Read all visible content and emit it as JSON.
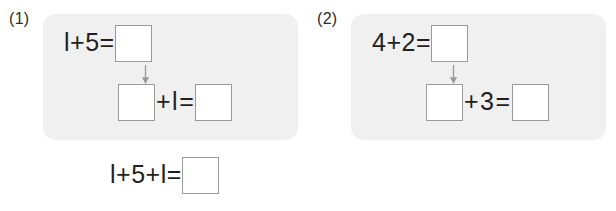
{
  "worksheet": {
    "title": "Two-step addition worksheet",
    "background_color": "#ffffff",
    "panel_color": "#f0f0f0",
    "box_border_color": "#9a9a9a",
    "text_color": "#231f20",
    "arrow_color": "#9b9b9b"
  },
  "problems": [
    {
      "label": "(1)",
      "step1": {
        "expression": "l+5=",
        "answer_value": ""
      },
      "step2": {
        "carried_value": "",
        "operator": "+",
        "addend": "l",
        "equals": "=",
        "answer_value": ""
      },
      "summary": {
        "expression": "l+5+l=",
        "answer_value": ""
      },
      "arrow_icon": "down-arrow-icon"
    },
    {
      "label": "(2)",
      "step1": {
        "expression": "4+2=",
        "answer_value": ""
      },
      "step2": {
        "carried_value": "",
        "operator": "+",
        "addend": "3",
        "equals": "=",
        "answer_value": ""
      },
      "summary": {
        "expression": "4+2+3=",
        "answer_value": ""
      },
      "arrow_icon": "down-arrow-icon"
    }
  ]
}
